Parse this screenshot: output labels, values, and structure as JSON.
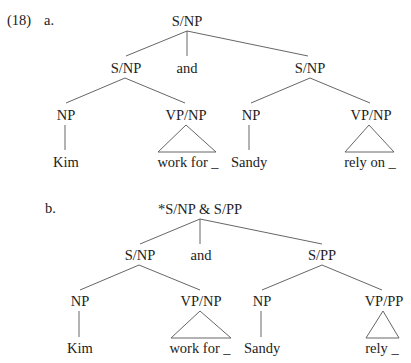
{
  "example_number": "(18)",
  "trees": {
    "a": {
      "label": "a.",
      "root": "S/NP",
      "left": {
        "label": "S/NP",
        "np": "NP",
        "np_word": "Kim",
        "vp": "VP/NP",
        "vp_word": "work for _"
      },
      "conj": "and",
      "right": {
        "label": "S/NP",
        "np": "NP",
        "np_word": "Sandy",
        "vp": "VP/NP",
        "vp_word": "rely on _"
      }
    },
    "b": {
      "label": "b.",
      "root": "*S/NP & S/PP",
      "left": {
        "label": "S/NP",
        "np": "NP",
        "np_word": "Kim",
        "vp": "VP/NP",
        "vp_word": "work for _"
      },
      "conj": "and",
      "right": {
        "label": "S/PP",
        "np": "NP",
        "np_word": "Sandy",
        "vp": "VP/PP",
        "vp_word": "rely _"
      }
    }
  }
}
